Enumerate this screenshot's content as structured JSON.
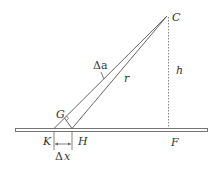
{
  "diagram": {
    "labels": {
      "C": "C",
      "G": "G",
      "K": "K",
      "H": "H",
      "F": "F",
      "h": "h",
      "r": "r",
      "delta_a": "Δa",
      "delta_x_symbol": "Δ",
      "delta_x_var": "x"
    },
    "colors": {
      "line": "#555555",
      "text": "#333333",
      "ground_fill": "#ffffff"
    }
  }
}
